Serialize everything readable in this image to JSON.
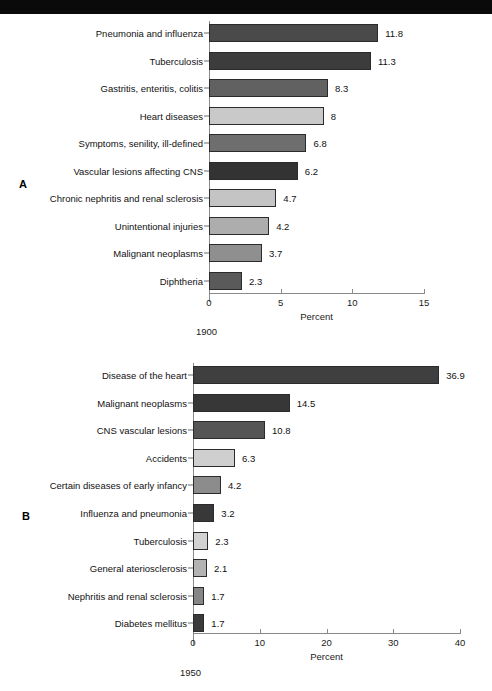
{
  "banner": {
    "text": "LOWEST TEN LEADING CAUSES OF DEATH IN THE UNITED STATES"
  },
  "panels": [
    {
      "letter": "A",
      "caption": "1900",
      "axis": {
        "title": "Percent",
        "min": 0,
        "max": 15,
        "ticks": [
          0,
          5,
          10,
          15
        ],
        "tick_labels": [
          "0",
          "5",
          "10",
          "15"
        ]
      },
      "chart_data": {
        "type": "bar",
        "orientation": "horizontal",
        "title": "1900",
        "xlabel": "Percent",
        "ylabel": "",
        "xlim": [
          0,
          15
        ],
        "grid": false,
        "legend": "none",
        "categories": [
          "Pneumonia and influenza",
          "Tuberculosis",
          "Gastritis, enteritis, colitis",
          "Heart diseases",
          "Symptoms, senility, ill-defined",
          "Vascular lesions affecting CNS",
          "Chronic nephritis and renal sclerosis",
          "Unintentional injuries",
          "Malignant neoplasms",
          "Diphtheria"
        ],
        "values": [
          11.8,
          11.3,
          8.3,
          8,
          6.8,
          6.2,
          4.7,
          4.2,
          3.7,
          2.3
        ],
        "value_labels": [
          "11.8",
          "11.3",
          "8.3",
          "8",
          "6.8",
          "6.2",
          "4.7",
          "4.2",
          "3.7",
          "2.3"
        ],
        "bar_colors": [
          "#4a4a4a",
          "#3c3c3c",
          "#616161",
          "#c9c9c9",
          "#6e6e6e",
          "#333333",
          "#c4c4c4",
          "#adadad",
          "#8f8f8f",
          "#5a5a5a"
        ]
      }
    },
    {
      "letter": "B",
      "caption": "1950",
      "axis": {
        "title": "Percent",
        "min": 0,
        "max": 40,
        "ticks": [
          0,
          10,
          20,
          30,
          40
        ],
        "tick_labels": [
          "0",
          "10",
          "20",
          "30",
          "40"
        ]
      },
      "chart_data": {
        "type": "bar",
        "orientation": "horizontal",
        "title": "1950",
        "xlabel": "Percent",
        "ylabel": "",
        "xlim": [
          0,
          40
        ],
        "grid": false,
        "legend": "none",
        "categories": [
          "Disease of the heart",
          "Malignant neoplasms",
          "CNS vascular lesions",
          "Accidents",
          "Certain diseases of early infancy",
          "Influenza and pneumonia",
          "Tuberculosis",
          "General ateriosclerosis",
          "Nephritis and renal sclerosis",
          "Diabetes mellitus"
        ],
        "values": [
          36.9,
          14.5,
          10.8,
          6.3,
          4.2,
          3.2,
          2.3,
          2.1,
          1.7,
          1.7
        ],
        "value_labels": [
          "36.9",
          "14.5",
          "10.8",
          "6.3",
          "4.2",
          "3.2",
          "2.3",
          "2.1",
          "1.7",
          "1.7"
        ],
        "bar_colors": [
          "#3f3f3f",
          "#373737",
          "#555555",
          "#cfcfcf",
          "#8c8c8c",
          "#383838",
          "#d2d2d2",
          "#b3b3b3",
          "#868686",
          "#3a3a3a"
        ]
      }
    }
  ]
}
